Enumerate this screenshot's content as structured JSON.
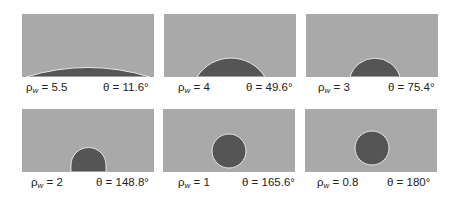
{
  "figure": {
    "panels": [
      {
        "rho_symbol": "ρ",
        "rho_sub": "w",
        "rho_text": " = 5.5",
        "theta_text": "θ = 11.6°",
        "rho_w": 5.5,
        "theta_deg": 11.6
      },
      {
        "rho_symbol": "ρ",
        "rho_sub": "w",
        "rho_text": " = 4",
        "theta_text": "θ = 49.6°",
        "rho_w": 4,
        "theta_deg": 49.6
      },
      {
        "rho_symbol": "ρ",
        "rho_sub": "w",
        "rho_text": " = 3",
        "theta_text": "θ = 75.4°",
        "rho_w": 3,
        "theta_deg": 75.4
      },
      {
        "rho_symbol": "ρ",
        "rho_sub": "w",
        "rho_text": " = 2",
        "theta_text": "θ = 148.8°",
        "rho_w": 2,
        "theta_deg": 148.8
      },
      {
        "rho_symbol": "ρ",
        "rho_sub": "w",
        "rho_text": " = 1",
        "theta_text": "θ = 165.6°",
        "rho_w": 1,
        "theta_deg": 165.6
      },
      {
        "rho_symbol": "ρ",
        "rho_sub": "w",
        "rho_text": " = 0.8",
        "theta_text": "θ = 180°",
        "rho_w": 0.8,
        "theta_deg": 180
      }
    ]
  },
  "colors": {
    "background": "#a9a9a9",
    "droplet": "#555555",
    "outline": "#e6e6e6"
  }
}
